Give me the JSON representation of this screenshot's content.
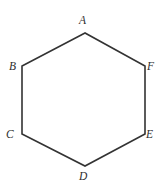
{
  "figure": {
    "kind": "geometric-diagram",
    "shape": "regular-hexagon",
    "canvas": {
      "width": 168,
      "height": 195
    },
    "background_color": "#ffffff",
    "stroke_color": "#333333",
    "stroke_width": 1.6,
    "fill_color": "none",
    "label_color": "#2e2e2e",
    "label_style": "italic-serif",
    "vertices": [
      {
        "id": "A",
        "label": "A",
        "x": 85,
        "y": 33,
        "label_position": "above"
      },
      {
        "id": "B",
        "label": "B",
        "x": 22,
        "y": 66,
        "label_position": "left"
      },
      {
        "id": "C",
        "label": "C",
        "x": 22,
        "y": 134,
        "label_position": "left"
      },
      {
        "id": "D",
        "label": "D",
        "x": 85,
        "y": 166,
        "label_position": "below"
      },
      {
        "id": "E",
        "label": "E",
        "x": 145,
        "y": 134,
        "label_position": "right"
      },
      {
        "id": "F",
        "label": "F",
        "x": 145,
        "y": 66,
        "label_position": "right"
      }
    ],
    "edges": [
      {
        "from": "A",
        "to": "B"
      },
      {
        "from": "B",
        "to": "C"
      },
      {
        "from": "C",
        "to": "D"
      },
      {
        "from": "D",
        "to": "E"
      },
      {
        "from": "E",
        "to": "F"
      },
      {
        "from": "F",
        "to": "A"
      }
    ],
    "polygon_points": "85,33 22,66 22,134 85,166 145,134 145,66"
  }
}
